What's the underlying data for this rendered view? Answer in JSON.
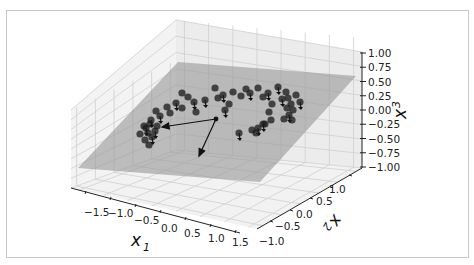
{
  "chart_data": {
    "type": "scatter3d",
    "title": "",
    "axes": {
      "x1": {
        "label": "x1",
        "ticks": [
          "-1.5",
          "-1.0",
          "-0.5",
          "0.0",
          "0.5",
          "1.0",
          "1.5"
        ],
        "range": [
          -1.8,
          1.8
        ]
      },
      "x2": {
        "label": "x2",
        "ticks": [
          "-1.0",
          "-0.5",
          "0.0",
          "0.5",
          "1.0"
        ],
        "range": [
          -1.3,
          1.3
        ]
      },
      "x3": {
        "label": "x3",
        "ticks": [
          "1.00",
          "0.75",
          "0.50",
          "0.25",
          "0.00",
          "-0.25",
          "-0.50",
          "-0.75",
          "-1.00"
        ],
        "range": [
          -1.0,
          1.0
        ]
      }
    },
    "grid": true,
    "plane": {
      "color": "#9a9a9a",
      "opacity": 0.6
    },
    "points_color": "#1a1a1a",
    "arrows": [
      {
        "name": "c1",
        "from": [
          0,
          0,
          0
        ],
        "direction": "toward -x1"
      },
      {
        "name": "c2",
        "from": [
          0,
          0,
          0
        ],
        "direction": "toward +x2 / down"
      }
    ],
    "points_screen": [
      [
        146,
        128
      ],
      [
        150,
        124
      ],
      [
        148,
        133
      ],
      [
        152,
        137
      ],
      [
        145,
        140
      ],
      [
        149,
        145
      ],
      [
        151,
        120
      ],
      [
        157,
        126
      ],
      [
        140,
        134
      ],
      [
        155,
        131
      ],
      [
        144,
        126
      ],
      [
        156,
        111
      ],
      [
        160,
        116
      ],
      [
        167,
        107
      ],
      [
        170,
        113
      ],
      [
        176,
        103
      ],
      [
        182,
        108
      ],
      [
        188,
        97
      ],
      [
        194,
        102
      ],
      [
        182,
        93
      ],
      [
        196,
        112
      ],
      [
        205,
        100
      ],
      [
        218,
        98
      ],
      [
        215,
        88
      ],
      [
        223,
        95
      ],
      [
        233,
        92
      ],
      [
        229,
        104
      ],
      [
        225,
        110
      ],
      [
        241,
        96
      ],
      [
        246,
        89
      ],
      [
        250,
        93
      ],
      [
        258,
        88
      ],
      [
        263,
        97
      ],
      [
        268,
        93
      ],
      [
        272,
        104
      ],
      [
        269,
        112
      ],
      [
        258,
        128
      ],
      [
        265,
        124
      ],
      [
        271,
        120
      ],
      [
        278,
        87
      ],
      [
        286,
        92
      ],
      [
        288,
        98
      ],
      [
        282,
        99
      ],
      [
        291,
        104
      ],
      [
        293,
        110
      ],
      [
        289,
        115
      ],
      [
        284,
        119
      ],
      [
        296,
        95
      ],
      [
        300,
        102
      ],
      [
        292,
        120
      ],
      [
        287,
        108
      ],
      [
        239,
        133
      ],
      [
        252,
        130
      ],
      [
        256,
        133
      ],
      [
        263,
        124
      ]
    ],
    "arrow_screen": {
      "origin": [
        216,
        119
      ],
      "tips": [
        [
          162,
          127
        ],
        [
          199,
          156
        ]
      ]
    }
  },
  "labels": {
    "x1": "x",
    "x1_sub": "1",
    "x2": "x",
    "x2_sub": "2",
    "x3": "x",
    "x3_sub": "3"
  }
}
